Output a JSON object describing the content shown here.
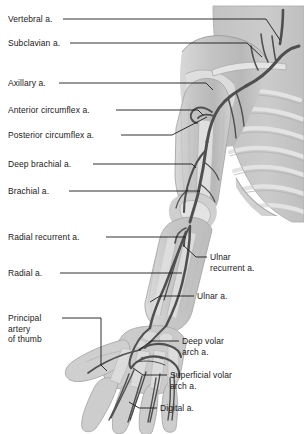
{
  "figure": {
    "background_color": "#ffffff",
    "text_color": "#1a1a1a",
    "body_fill": "#c9c9c9",
    "body_fill_light": "#dedede",
    "bone_fill": "#e6e6e6",
    "artery_color": "#4a4a4a",
    "leader_color": "#1a1a1a"
  },
  "labels_left": [
    {
      "id": "vertebral",
      "text": "Vertebral a.",
      "x": 8,
      "y": 14
    },
    {
      "id": "subclavian",
      "text": "Subclavian a.",
      "x": 8,
      "y": 38
    },
    {
      "id": "axillary",
      "text": "Axillary a.",
      "x": 8,
      "y": 78
    },
    {
      "id": "anterior-circumflex",
      "text": "Anterior circumflex a.",
      "x": 8,
      "y": 105
    },
    {
      "id": "posterior-circumflex",
      "text": "Posterior circumflex a.",
      "x": 8,
      "y": 130
    },
    {
      "id": "deep-brachial",
      "text": "Deep brachial a.",
      "x": 8,
      "y": 159
    },
    {
      "id": "brachial",
      "text": "Brachial a.",
      "x": 8,
      "y": 186
    },
    {
      "id": "radial-recurrent",
      "text": "Radial recurrent a.",
      "x": 8,
      "y": 232
    },
    {
      "id": "radial",
      "text": "Radial a.",
      "x": 8,
      "y": 268
    },
    {
      "id": "principal-artery-of-thumb",
      "text": "Principal\nartery\nof thumb",
      "x": 8,
      "y": 313
    }
  ],
  "labels_right": [
    {
      "id": "ulnar-recurrent",
      "text": "Ulnar\nrecurrent a.",
      "x": 210,
      "y": 252
    },
    {
      "id": "ulnar",
      "text": "Ulnar a.",
      "x": 197,
      "y": 291
    },
    {
      "id": "deep-volar-arch",
      "text": "Deep volar\narch a.",
      "x": 182,
      "y": 336
    },
    {
      "id": "superficial-volar-arch",
      "text": "Superficial volar\narch a.",
      "x": 170,
      "y": 370
    },
    {
      "id": "digital",
      "text": "Digital a.",
      "x": 160,
      "y": 403
    }
  ],
  "leaders_left": [
    {
      "id": "vertebral",
      "points": "63,19 266,19 280,40"
    },
    {
      "id": "subclavian",
      "points": "70,43 247,43 262,57"
    },
    {
      "id": "axillary",
      "points": "59,83 206,83 213,90"
    },
    {
      "id": "anterior-circumflex",
      "points": "116,110 198,110 203,115"
    },
    {
      "id": "posterior-circumflex",
      "points": "121,135 172,135 207,117"
    },
    {
      "id": "deep-brachial",
      "points": "93,164 192,164 196,168"
    },
    {
      "id": "brachial",
      "points": "69,191 200,191"
    },
    {
      "id": "radial-recurrent",
      "points": "106,237 186,237"
    },
    {
      "id": "radial",
      "points": "60,273 182,273"
    },
    {
      "id": "principal-artery-of-thumb",
      "points": "62,318 101,318 101,365 107,371"
    }
  ],
  "leaders_right": [
    {
      "id": "ulnar-recurrent",
      "points": "207,257 196,257 183,245"
    },
    {
      "id": "ulnar",
      "points": "194,296 160,296 150,302"
    },
    {
      "id": "deep-volar-arch",
      "points": "179,341 151,341 139,350"
    },
    {
      "id": "superficial-volar-arch",
      "points": "167,375 143,375 133,368"
    },
    {
      "id": "digital",
      "points": "157,408 139,408 129,402"
    }
  ],
  "anatomy_parts": [
    "torso",
    "ribs",
    "clavicle",
    "scapula",
    "humerus",
    "radius",
    "ulna",
    "carpal-bones",
    "metacarpals",
    "phalanges",
    "thumb",
    "subclavian-artery",
    "vertebral-artery",
    "axillary-artery",
    "brachial-artery",
    "deep-brachial-artery",
    "anterior-circumflex-artery",
    "posterior-circumflex-artery",
    "radial-artery",
    "ulnar-artery",
    "radial-recurrent-artery",
    "ulnar-recurrent-artery",
    "deep-volar-arch",
    "superficial-volar-arch",
    "digital-arteries",
    "principal-artery-of-thumb"
  ]
}
